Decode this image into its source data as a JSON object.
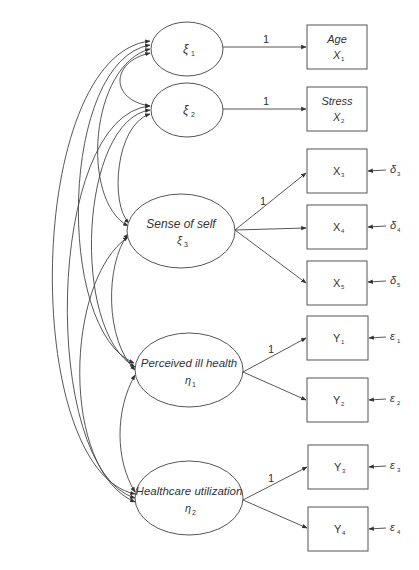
{
  "diagram": {
    "type": "structural-equation-model",
    "latent": [
      {
        "id": "xi1",
        "name": "",
        "symbol": "ξ",
        "sub": "1"
      },
      {
        "id": "xi2",
        "name": "",
        "symbol": "ξ",
        "sub": "2"
      },
      {
        "id": "xi3",
        "name": "Sense of self",
        "symbol": "ξ",
        "sub": "3"
      },
      {
        "id": "eta1",
        "name": "Perceived ill health",
        "symbol": "η",
        "sub": "1"
      },
      {
        "id": "eta2",
        "name": "Healthcare utilization",
        "symbol": "η",
        "sub": "2"
      }
    ],
    "observed": [
      {
        "id": "X1",
        "name": "Age",
        "symbol": "X",
        "sub": "1"
      },
      {
        "id": "X2",
        "name": "Stress",
        "symbol": "X",
        "sub": "2"
      },
      {
        "id": "X3",
        "name": "",
        "symbol": "X",
        "sub": "3",
        "error": {
          "symbol": "δ",
          "sub": "3"
        }
      },
      {
        "id": "X4",
        "name": "",
        "symbol": "X",
        "sub": "4",
        "error": {
          "symbol": "δ",
          "sub": "4"
        }
      },
      {
        "id": "X5",
        "name": "",
        "symbol": "X",
        "sub": "5",
        "error": {
          "symbol": "δ",
          "sub": "5"
        }
      },
      {
        "id": "Y1",
        "name": "",
        "symbol": "Y",
        "sub": "1",
        "error": {
          "symbol": "ε",
          "sub": "1"
        }
      },
      {
        "id": "Y2",
        "name": "",
        "symbol": "Y",
        "sub": "2",
        "error": {
          "symbol": "ε",
          "sub": "2"
        }
      },
      {
        "id": "Y3",
        "name": "",
        "symbol": "Y",
        "sub": "3",
        "error": {
          "symbol": "ε",
          "sub": "3"
        }
      },
      {
        "id": "Y4",
        "name": "",
        "symbol": "Y",
        "sub": "4",
        "error": {
          "symbol": "ε",
          "sub": "4"
        }
      }
    ],
    "loadings": [
      {
        "from": "xi1",
        "to": "X1",
        "label": "1"
      },
      {
        "from": "xi2",
        "to": "X2",
        "label": "1"
      },
      {
        "from": "xi3",
        "to": "X3",
        "label": "1"
      },
      {
        "from": "xi3",
        "to": "X4",
        "label": ""
      },
      {
        "from": "xi3",
        "to": "X5",
        "label": ""
      },
      {
        "from": "eta1",
        "to": "Y1",
        "label": "1"
      },
      {
        "from": "eta1",
        "to": "Y2",
        "label": ""
      },
      {
        "from": "eta2",
        "to": "Y3",
        "label": "1"
      },
      {
        "from": "eta2",
        "to": "Y4",
        "label": ""
      }
    ],
    "covariances": [
      [
        "xi1",
        "xi2"
      ],
      [
        "xi1",
        "xi3"
      ],
      [
        "xi1",
        "eta1"
      ],
      [
        "xi1",
        "eta2"
      ],
      [
        "xi2",
        "xi3"
      ],
      [
        "xi2",
        "eta1"
      ],
      [
        "xi2",
        "eta2"
      ],
      [
        "xi3",
        "eta1"
      ],
      [
        "xi3",
        "eta2"
      ],
      [
        "eta1",
        "eta2"
      ]
    ]
  },
  "labels": {
    "one": "1",
    "xi": "ξ",
    "eta": "η",
    "delta": "δ",
    "epsilon": "ε",
    "age": "Age",
    "stress": "Stress",
    "sense_of_self": "Sense of self",
    "perceived_ill_health": "Perceived ill health",
    "healthcare_utilization": "Healthcare utilization",
    "X": "X",
    "Y": "Y",
    "s1": "1",
    "s2": "2",
    "s3": "3",
    "s4": "4",
    "s5": "5"
  },
  "colors": {
    "stroke": "#555555",
    "text": "#333333",
    "background": "#ffffff"
  }
}
